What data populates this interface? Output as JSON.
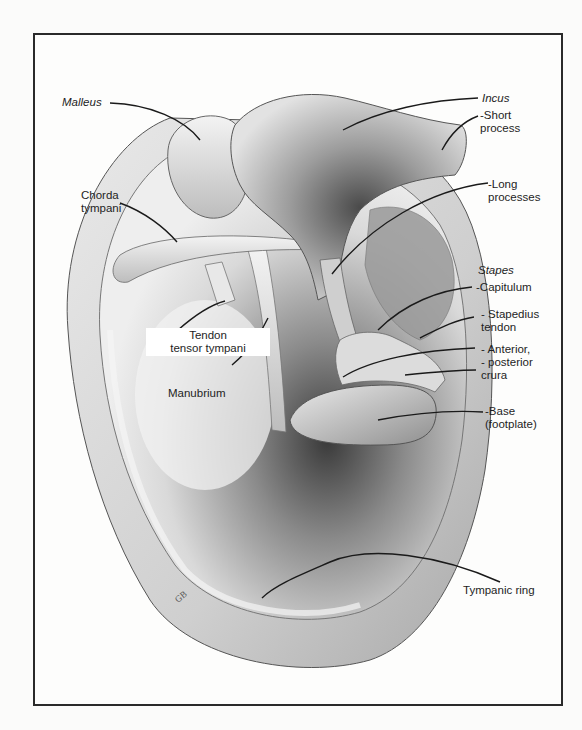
{
  "figure": {
    "signature": "GB",
    "colors": {
      "frame": "#2a2a2a",
      "ink": "#1e1e1e",
      "background": "#fdfdfc"
    }
  },
  "labels": {
    "malleus": {
      "lines": [
        "Malleus"
      ],
      "italic": true
    },
    "chorda_tympani": {
      "lines": [
        "Chorda",
        "tympani"
      ],
      "italic": false
    },
    "tendon_tensor_tympani": {
      "lines": [
        "Tendon",
        "tensor tympani"
      ],
      "italic": false
    },
    "manubrium": {
      "lines": [
        "Manubrium"
      ],
      "italic": false
    },
    "incus": {
      "lines": [
        "Incus"
      ],
      "italic": true
    },
    "short_process": {
      "lines": [
        "-Short",
        "process"
      ],
      "italic": false
    },
    "long_processes": {
      "lines": [
        "-Long",
        "processes"
      ],
      "italic": false
    },
    "stapes": {
      "lines": [
        "Stapes"
      ],
      "italic": true
    },
    "capitulum": {
      "lines": [
        "-Capitulum"
      ],
      "italic": false
    },
    "stapedius_tendon": {
      "lines": [
        "- Stapedius",
        "tendon"
      ],
      "italic": false
    },
    "anterior_posterior_crura": {
      "lines": [
        "- Anterior,",
        "- posterior",
        "crura"
      ],
      "italic": false
    },
    "base_footplate": {
      "lines": [
        "-Base",
        "(footplate)"
      ],
      "italic": false
    },
    "tympanic_ring": {
      "lines": [
        "Tympanic ring"
      ],
      "italic": false
    }
  }
}
